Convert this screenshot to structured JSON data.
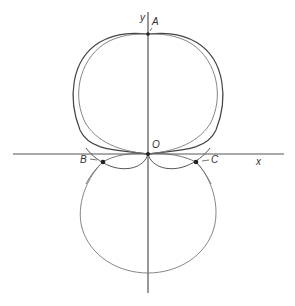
{
  "diagram": {
    "axes": {
      "x_label": "x",
      "y_label": "y"
    },
    "points": {
      "A": "A",
      "O": "O",
      "B": "B",
      "C": "C"
    },
    "colors": {
      "stroke": "#444444",
      "light_stroke": "#7a7a7a",
      "background": "#ffffff"
    }
  }
}
